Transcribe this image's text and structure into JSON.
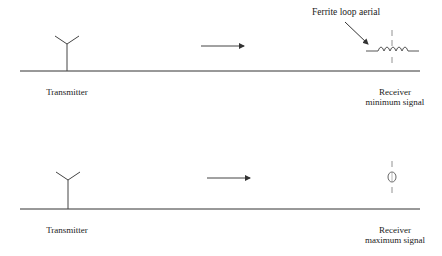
{
  "diagram": {
    "top_panel": {
      "transmitter_label": "Transmitter",
      "annotation": "Ferrite loop aerial",
      "receiver_label_line1": "Receiver",
      "receiver_label_line2": "minimum signal"
    },
    "bottom_panel": {
      "transmitter_label": "Transmitter",
      "receiver_label_line1": "Receiver",
      "receiver_label_line2": "maximum signal"
    },
    "colors": {
      "line": "#333333",
      "background": "#ffffff"
    }
  }
}
